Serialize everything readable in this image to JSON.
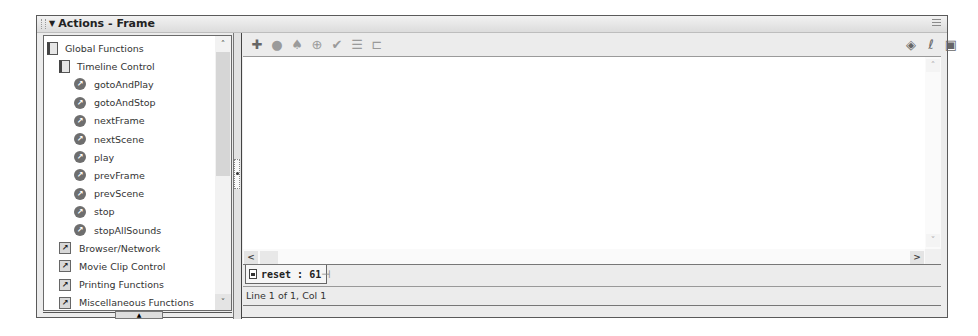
{
  "panel": {
    "title": "Actions - Frame",
    "collapse_glyph": "▼"
  },
  "tree": {
    "items": [
      {
        "label": "Global Functions",
        "icon": "book-icon",
        "level": 0
      },
      {
        "label": "Timeline Control",
        "icon": "book-icon",
        "level": 1
      },
      {
        "label": "gotoAndPlay",
        "icon": "action-circle-icon",
        "level": 2
      },
      {
        "label": "gotoAndStop",
        "icon": "action-circle-icon",
        "level": 2
      },
      {
        "label": "nextFrame",
        "icon": "action-circle-icon",
        "level": 2
      },
      {
        "label": "nextScene",
        "icon": "action-circle-icon",
        "level": 2
      },
      {
        "label": "play",
        "icon": "action-circle-icon",
        "level": 2
      },
      {
        "label": "prevFrame",
        "icon": "action-circle-icon",
        "level": 2
      },
      {
        "label": "prevScene",
        "icon": "action-circle-icon",
        "level": 2
      },
      {
        "label": "stop",
        "icon": "action-circle-icon",
        "level": 2
      },
      {
        "label": "stopAllSounds",
        "icon": "action-circle-icon",
        "level": 2
      },
      {
        "label": "Browser/Network",
        "icon": "folder-arrow-icon",
        "level": 1
      },
      {
        "label": "Movie Clip Control",
        "icon": "folder-arrow-icon",
        "level": 1
      },
      {
        "label": "Printing Functions",
        "icon": "folder-arrow-icon",
        "level": 1
      },
      {
        "label": "Miscellaneous Functions",
        "icon": "folder-arrow-icon",
        "level": 1
      }
    ]
  },
  "toolbar": {
    "left": [
      {
        "name": "add-statement-icon",
        "glyph": "✚"
      },
      {
        "name": "find-icon",
        "glyph": "●"
      },
      {
        "name": "replace-icon",
        "glyph": "♠"
      },
      {
        "name": "insert-target-path-icon",
        "glyph": "⊕"
      },
      {
        "name": "check-syntax-icon",
        "glyph": "✔"
      },
      {
        "name": "auto-format-icon",
        "glyph": "☰"
      },
      {
        "name": "show-code-hint-icon",
        "glyph": "⊏"
      }
    ],
    "right": [
      {
        "name": "reference-icon",
        "glyph": "◈"
      },
      {
        "name": "debug-options-icon",
        "glyph": "ℓ"
      },
      {
        "name": "view-options-icon",
        "glyph": "▣"
      }
    ]
  },
  "editor": {
    "scroll_up": "˄",
    "scroll_down": "˅",
    "scroll_left": "<",
    "scroll_right": ">"
  },
  "script_tab": {
    "label": "reset : 61",
    "pin_glyph": "⊣"
  },
  "status": {
    "text": "Line 1 of 1, Col 1"
  },
  "left_scroll": {
    "up": "˄",
    "down": "˅"
  }
}
